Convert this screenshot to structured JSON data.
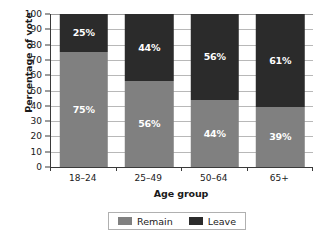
{
  "chart_data": {
    "type": "bar",
    "subtype": "stacked-percentage",
    "title": "",
    "xlabel": "Age group",
    "ylabel": "Percentage of vote",
    "categories": [
      "18–24",
      "25–49",
      "50–64",
      "65+"
    ],
    "series": [
      {
        "name": "Remain",
        "color": "#808080",
        "values": [
          75,
          56,
          44,
          39
        ],
        "labels": [
          "75%",
          "56%",
          "44%",
          "39%"
        ]
      },
      {
        "name": "Leave",
        "color": "#2b2b2b",
        "values": [
          25,
          44,
          56,
          61
        ],
        "labels": [
          "25%",
          "44%",
          "56%",
          "61%"
        ]
      }
    ],
    "stack_order_top_to_bottom": [
      "Leave",
      "Remain"
    ],
    "ylim": [
      0,
      100
    ],
    "ytick_step": 10,
    "yticks": [
      100,
      90,
      80,
      70,
      60,
      50,
      40,
      30,
      20,
      10,
      0
    ],
    "ytick_labels": [
      "100",
      "90",
      "80",
      "70",
      "60",
      "50",
      "40",
      "30",
      "20",
      "10",
      "0"
    ],
    "grid": true,
    "grid_axis": "y",
    "legend_position": "bottom",
    "legend_entries": [
      "Remain",
      "Leave"
    ]
  },
  "axes": {
    "y_title": "Percentage of vote",
    "x_title": "Age group"
  },
  "legend": {
    "items": [
      {
        "label": "Remain",
        "color": "#808080"
      },
      {
        "label": "Leave",
        "color": "#2b2b2b"
      }
    ]
  },
  "colors": {
    "remain": "#808080",
    "leave": "#2b2b2b",
    "axis": "#3a3a3a",
    "grid": "#b8b8b8",
    "background": "#ffffff",
    "value_label": "#ffffff"
  }
}
